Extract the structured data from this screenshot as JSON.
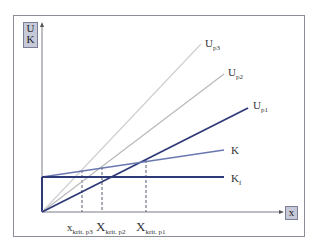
{
  "diagram": {
    "type": "break-even / critical quantity diagram",
    "y_axis_label": [
      "U",
      "K"
    ],
    "x_axis_label": "x",
    "origin": [
      42,
      212
    ],
    "colors": {
      "frame": "#8a8c96",
      "axis": "#7a7c86",
      "up1": "#2e3a78",
      "up2": "#b8b8bc",
      "up3": "#cfd0d4",
      "k": "#6a78b0",
      "kf": "#2e3a78",
      "dashed": "#555a70",
      "label_box": "#c6cad8"
    },
    "lines": [
      {
        "id": "up3",
        "label": "U",
        "sub": "p3",
        "from": [
          42,
          212
        ],
        "to": [
          201,
          44
        ]
      },
      {
        "id": "up2",
        "label": "U",
        "sub": "p2",
        "from": [
          42,
          212
        ],
        "to": [
          224,
          74
        ]
      },
      {
        "id": "up1",
        "label": "U",
        "sub": "p1",
        "from": [
          42,
          212
        ],
        "to": [
          248,
          108
        ]
      },
      {
        "id": "k",
        "label": "K",
        "sub": "",
        "from": [
          42,
          177
        ],
        "to": [
          224,
          150
        ]
      },
      {
        "id": "kf",
        "label": "K",
        "sub": "f",
        "from": [
          42,
          177
        ],
        "to": [
          224,
          177
        ]
      }
    ],
    "critical_points": [
      {
        "label": "x",
        "sub": "krit. p3",
        "x": 82
      },
      {
        "label": "X",
        "sub": "krit. p2",
        "x": 102
      },
      {
        "label": "X",
        "sub": "krit. p1",
        "x": 146
      }
    ]
  }
}
